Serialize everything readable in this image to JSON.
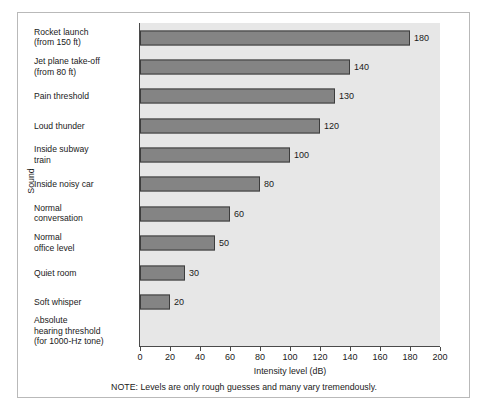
{
  "chart_data": {
    "type": "bar",
    "orientation": "horizontal",
    "title": "",
    "xlabel": "Intensity level (dB)",
    "ylabel": "Sound",
    "xlim": [
      0,
      200
    ],
    "xticks": [
      0,
      20,
      40,
      60,
      80,
      100,
      120,
      140,
      160,
      180,
      200
    ],
    "grid": false,
    "legend": false,
    "note": "NOTE:  Levels are only rough guesses and many vary tremendously.",
    "note_tag": "NOTE:",
    "note_body": "Levels are only rough guesses and many vary tremendously.",
    "categories": [
      "Rocket launch (from 150 ft)",
      "Jet plane take-off (from 80 ft)",
      "Pain threshold",
      "Loud thunder",
      "Inside subway train",
      "Inside noisy car",
      "Normal conversation",
      "Normal office level",
      "Quiet room",
      "Soft whisper",
      "Absolute hearing threshold (for 1000-Hz tone)"
    ],
    "values": [
      180,
      140,
      130,
      120,
      100,
      80,
      60,
      50,
      30,
      20,
      0
    ],
    "bars": [
      {
        "label_lines": [
          "Rocket launch",
          "(from 150 ft)"
        ],
        "value": 180,
        "value_label": "180"
      },
      {
        "label_lines": [
          "Jet plane take-off",
          "(from 80 ft)"
        ],
        "value": 140,
        "value_label": "140"
      },
      {
        "label_lines": [
          "Pain threshold"
        ],
        "value": 130,
        "value_label": "130"
      },
      {
        "label_lines": [
          "Loud thunder"
        ],
        "value": 120,
        "value_label": "120"
      },
      {
        "label_lines": [
          "Inside subway",
          "train"
        ],
        "value": 100,
        "value_label": "100"
      },
      {
        "label_lines": [
          "Inside noisy car"
        ],
        "value": 80,
        "value_label": "80"
      },
      {
        "label_lines": [
          "Normal",
          "conversation"
        ],
        "value": 60,
        "value_label": "60"
      },
      {
        "label_lines": [
          "Normal",
          "office level"
        ],
        "value": 50,
        "value_label": "50"
      },
      {
        "label_lines": [
          "Quiet room"
        ],
        "value": 30,
        "value_label": "30"
      },
      {
        "label_lines": [
          "Soft whisper"
        ],
        "value": 20,
        "value_label": "20"
      },
      {
        "label_lines": [
          "Absolute",
          "hearing threshold",
          "(for 1000-Hz tone)"
        ],
        "value": 0,
        "value_label": ""
      }
    ],
    "colors": {
      "bar_fill": "#848484",
      "bar_edge": "#3d3d3d",
      "plot_background": "#e7e7e7",
      "figure_background": "#ffffff",
      "frame_border": "#b9b9b9",
      "axis": "#4a4a4a",
      "text": "#1a1a1a"
    }
  }
}
